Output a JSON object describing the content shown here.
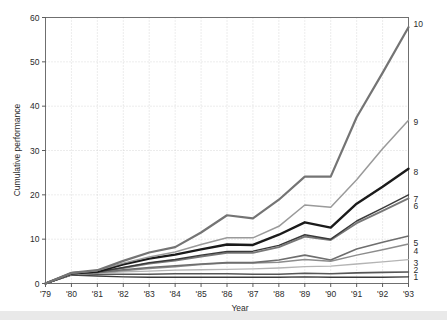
{
  "chart_data": {
    "type": "line",
    "title": "",
    "xlabel": "Year",
    "ylabel": "Cumulative performance",
    "x": [
      "'79",
      "'80",
      "'81",
      "'82",
      "'83",
      "'84",
      "'85",
      "'86",
      "'87",
      "'88",
      "'89",
      "'90",
      "'91",
      "'92",
      "'93"
    ],
    "x_values": [
      1979,
      1980,
      1981,
      1982,
      1983,
      1984,
      1985,
      1986,
      1987,
      1988,
      1989,
      1990,
      1991,
      1992,
      1993
    ],
    "xlim": [
      1979,
      1993
    ],
    "ylim": [
      0,
      60
    ],
    "yticks": [
      0,
      10,
      20,
      30,
      40,
      50,
      60
    ],
    "ytick_labels": [
      "0",
      "10",
      "20",
      "30",
      "40",
      "50",
      "60"
    ],
    "grid": true,
    "grid_style": "dotted",
    "legend_position": "right-edge-inline",
    "series": [
      {
        "name": "1",
        "label": "1",
        "color": "#3c3c3c",
        "width": 1.4,
        "values": [
          0,
          1.9,
          1.7,
          1.5,
          1.4,
          1.4,
          1.4,
          1.4,
          1.4,
          1.4,
          1.5,
          1.4,
          1.4,
          1.4,
          1.5
        ]
      },
      {
        "name": "2",
        "label": "2",
        "color": "#565656",
        "width": 1.6,
        "values": [
          0,
          2.0,
          2.1,
          2.1,
          2.1,
          2.2,
          2.2,
          2.2,
          2.1,
          2.1,
          2.3,
          2.2,
          2.4,
          2.5,
          2.6
        ]
      },
      {
        "name": "3",
        "label": "3",
        "color": "#b4b4b4",
        "width": 1.3,
        "values": [
          0,
          2.0,
          2.3,
          2.6,
          2.8,
          3.0,
          3.1,
          3.2,
          3.3,
          3.5,
          3.8,
          3.9,
          4.4,
          4.9,
          5.4
        ]
      },
      {
        "name": "4",
        "label": "4",
        "color": "#8c8c8c",
        "width": 1.5,
        "values": [
          0,
          2.1,
          2.4,
          2.9,
          3.4,
          3.8,
          4.3,
          4.6,
          4.6,
          4.8,
          5.4,
          5.0,
          6.4,
          7.6,
          8.9
        ]
      },
      {
        "name": "5",
        "label": "5",
        "color": "#6e6e6e",
        "width": 1.6,
        "values": [
          0,
          2.1,
          2.5,
          3.1,
          3.6,
          4.0,
          4.4,
          4.7,
          4.7,
          5.3,
          6.4,
          5.3,
          7.8,
          9.3,
          10.7
        ]
      },
      {
        "name": "6",
        "label": "6",
        "color": "#787878",
        "width": 1.9,
        "values": [
          0,
          2.2,
          2.5,
          3.5,
          4.5,
          5.2,
          6.1,
          6.9,
          6.9,
          8.2,
          10.6,
          9.8,
          13.6,
          16.4,
          19.2
        ]
      },
      {
        "name": "7",
        "label": "7",
        "color": "#3a3a3a",
        "width": 1.5,
        "values": [
          0,
          2.2,
          2.6,
          3.6,
          4.7,
          5.4,
          6.4,
          7.2,
          7.3,
          8.6,
          11.0,
          10.0,
          14.1,
          17.0,
          20.0
        ]
      },
      {
        "name": "8",
        "label": "8",
        "color": "#1a1a1a",
        "width": 2.4,
        "values": [
          0,
          2.3,
          2.7,
          4.3,
          5.6,
          6.5,
          7.7,
          8.8,
          8.7,
          11.0,
          13.8,
          12.6,
          18.0,
          21.8,
          25.9
        ]
      },
      {
        "name": "9",
        "label": "9",
        "color": "#9a9a9a",
        "width": 1.5,
        "values": [
          0,
          2.3,
          2.9,
          4.6,
          6.0,
          7.1,
          8.8,
          10.3,
          10.3,
          12.9,
          17.7,
          17.2,
          23.4,
          30.4,
          36.8
        ]
      },
      {
        "name": "10",
        "label": "10",
        "color": "#747474",
        "width": 2.2,
        "values": [
          0,
          2.4,
          3.0,
          5.1,
          7.0,
          8.2,
          11.5,
          15.4,
          14.7,
          18.9,
          24.1,
          24.1,
          37.5,
          47.5,
          57.8
        ]
      }
    ]
  },
  "axes": {
    "y_axis_title": "Cumulative performance",
    "x_axis_title": "Year"
  }
}
